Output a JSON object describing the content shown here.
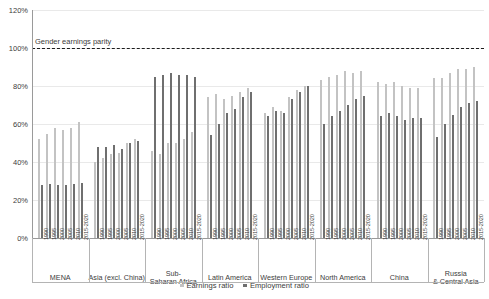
{
  "chart_data": {
    "type": "bar",
    "title": "",
    "xlabel": "",
    "ylabel": "",
    "ylim": [
      0,
      120
    ],
    "ytick_labels": [
      "0%",
      "20%",
      "40%",
      "60%",
      "80%",
      "100%",
      "120%"
    ],
    "ytick_values": [
      0,
      20,
      40,
      60,
      80,
      100,
      120
    ],
    "grid": true,
    "legend_position": "bottom-center",
    "annotations": [
      {
        "text": "Gender earnings parity",
        "value": 100,
        "style": "dashed-horizontal-line"
      }
    ],
    "series": [
      {
        "name": "Earnings ratio",
        "color": "#c3c3c3"
      },
      {
        "name": "Employment ratio",
        "color": "#6f6f6f"
      }
    ],
    "x": [
      "1990",
      "1995",
      "2000",
      "2005",
      "2010",
      "2015-2020"
    ],
    "groups": [
      {
        "name": "MENA",
        "earnings_ratio": [
          52,
          55,
          58,
          57,
          58,
          61
        ],
        "employment_ratio": [
          28,
          28.5,
          28,
          28,
          28.5,
          29
        ]
      },
      {
        "name": "Asia (excl. China)",
        "earnings_ratio": [
          40,
          42,
          44,
          45,
          50,
          52
        ],
        "employment_ratio": [
          48,
          48,
          49,
          47,
          50,
          51
        ]
      },
      {
        "name": "Sub-Saharan Africa",
        "earnings_ratio": [
          46,
          44,
          50,
          50,
          52,
          56
        ],
        "employment_ratio": [
          85,
          86,
          87,
          86,
          86,
          85
        ]
      },
      {
        "name": "Latin America",
        "earnings_ratio": [
          74,
          76,
          73,
          75,
          77,
          79
        ],
        "employment_ratio": [
          54,
          60,
          66,
          68,
          74,
          77
        ]
      },
      {
        "name": "Western Europe",
        "earnings_ratio": [
          66,
          69,
          67,
          74,
          78,
          80
        ],
        "employment_ratio": [
          64,
          67,
          66,
          73,
          77,
          80
        ]
      },
      {
        "name": "North America",
        "earnings_ratio": [
          83,
          85,
          86,
          88,
          87,
          88
        ],
        "employment_ratio": [
          60,
          64,
          67,
          70,
          73,
          75
        ]
      },
      {
        "name": "China",
        "earnings_ratio": [
          82,
          81,
          82,
          80,
          79,
          79
        ],
        "employment_ratio": [
          64,
          66,
          64,
          62,
          63,
          63
        ]
      },
      {
        "name": "Russia & Central Asia",
        "earnings_ratio": [
          84,
          84,
          87,
          89,
          89,
          90
        ],
        "employment_ratio": [
          53,
          60,
          65,
          69,
          71,
          72
        ]
      }
    ]
  },
  "legend": {
    "earnings_label": "Earnings ratio",
    "employment_label": "Employment ratio"
  }
}
